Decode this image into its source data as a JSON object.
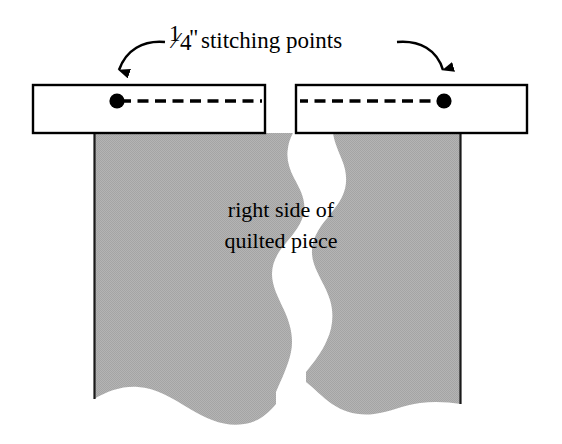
{
  "figure": {
    "title_caption": "¼\" stitching points",
    "caption_parts": {
      "fraction_numerator": "1",
      "fraction_denominator": "4",
      "inch_mark": "\"",
      "rest": "stitching points"
    },
    "body_label_line1": "right side of",
    "body_label_line2": "quilted piece",
    "annotations": {
      "left_arrow": "arrow pointing to left stitching point",
      "right_arrow": "arrow pointing to right stitching point",
      "left_point": "left quarter-inch stitching point marker",
      "right_point": "right quarter-inch stitching point marker",
      "seam_line": "dashed seam stitching line",
      "binding_strip_left": "left binding strip",
      "binding_strip_right": "right binding strip",
      "quilt_left": "left torn quilt panel",
      "quilt_right": "right torn quilt panel"
    },
    "colors": {
      "ink": "#000000",
      "paper": "#ffffff",
      "quilt_fill": "#b0b0b0",
      "quilt_edge": "#1a1a1a"
    },
    "measurements": {
      "canvas_width": 562,
      "canvas_height": 444
    }
  }
}
